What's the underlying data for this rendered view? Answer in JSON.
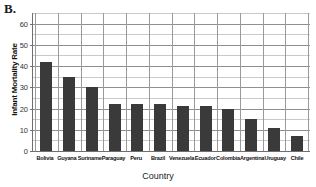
{
  "panel": {
    "label": "B."
  },
  "chart_data": {
    "type": "bar",
    "title": "",
    "xlabel": "Country",
    "ylabel": "Infant Mortality Rate",
    "categories": [
      "Bolivia",
      "Guyana",
      "Suriname",
      "Paraguay",
      "Peru",
      "Brazil",
      "Venezuela",
      "Ecuador",
      "Colombia",
      "Argentina",
      "Uruguay",
      "Chile"
    ],
    "values": [
      42,
      35,
      30,
      22,
      22,
      22,
      21,
      21,
      20,
      15,
      11,
      7
    ],
    "ylim": [
      0,
      65
    ],
    "ytick_labels": [
      "0",
      "10",
      "20",
      "30",
      "40",
      "50",
      "60"
    ],
    "ytick_values": [
      0,
      10,
      20,
      30,
      40,
      50,
      60
    ],
    "minor_tick_step": 5,
    "grid": "both",
    "legend": "none",
    "bar_color": "#3a3a3a",
    "grid_color": "#8f8f8f",
    "axis_color": "#6f6f6f"
  }
}
